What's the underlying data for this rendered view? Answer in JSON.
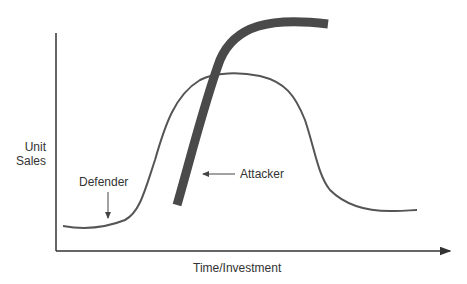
{
  "diagram": {
    "axes": {
      "y_label_line1": "Unit",
      "y_label_line2": "Sales",
      "x_label": "Time/Investment"
    },
    "curves": {
      "defender": {
        "label": "Defender",
        "color": "#555555",
        "description": "bell-shaped thin curve"
      },
      "attacker": {
        "label": "Attacker",
        "color": "#4a4a4a",
        "description": "thick S-curve rising steeply"
      }
    },
    "colors": {
      "axis": "#333333",
      "text": "#333333"
    }
  }
}
